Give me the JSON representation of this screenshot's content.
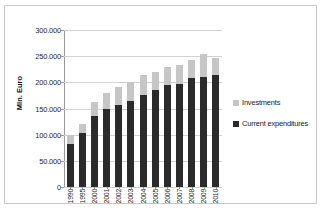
{
  "chart_data": {
    "type": "bar",
    "subtype": "stacked-column",
    "title": "",
    "xlabel": "",
    "ylabel": "Mln. Euro",
    "ylim": [
      0,
      300000
    ],
    "ytick_values": [
      0,
      50000,
      100000,
      150000,
      200000,
      250000,
      300000
    ],
    "ytick_labels": [
      "0",
      "50.000",
      "100.000",
      "150.000",
      "200.000",
      "250.000",
      "300.000"
    ],
    "grid": true,
    "legend_position": "right",
    "categories": [
      "1990",
      "1995",
      "2000",
      "2001",
      "2002",
      "2003",
      "2004",
      "2005",
      "2006",
      "2007",
      "2008",
      "2009",
      "2010"
    ],
    "series": [
      {
        "name": "Current expenditures",
        "color": "#2b2b2b",
        "values": [
          83000,
          104000,
          136000,
          150000,
          157000,
          165000,
          176000,
          185000,
          194000,
          196000,
          209000,
          211000,
          214000
        ]
      },
      {
        "name": "Investments",
        "color": "#c6c6c6",
        "values": [
          17000,
          16000,
          27000,
          30000,
          34000,
          36000,
          38000,
          34000,
          36000,
          37000,
          34000,
          44000,
          33000
        ]
      }
    ],
    "totals": [
      100000,
      120000,
      163000,
      180000,
      191000,
      201000,
      214000,
      219000,
      230000,
      233000,
      243000,
      255000,
      247000
    ]
  },
  "legend": {
    "items": [
      {
        "label": "Investments",
        "color": "#c6c6c6"
      },
      {
        "label": "Current expenditures",
        "color": "#2b2b2b"
      }
    ]
  }
}
